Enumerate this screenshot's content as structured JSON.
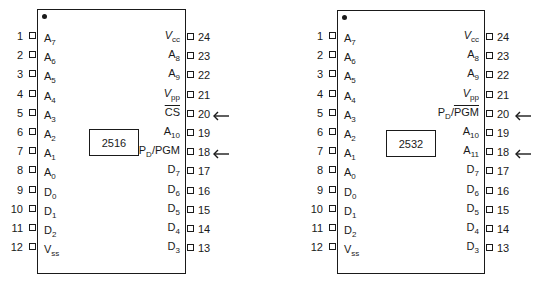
{
  "chips": [
    {
      "part_number": "2516",
      "left_pins": [
        {
          "num": "1",
          "name": "A",
          "sub": "7"
        },
        {
          "num": "2",
          "name": "A",
          "sub": "6"
        },
        {
          "num": "3",
          "name": "A",
          "sub": "5"
        },
        {
          "num": "4",
          "name": "A",
          "sub": "4"
        },
        {
          "num": "5",
          "name": "A",
          "sub": "3"
        },
        {
          "num": "6",
          "name": "A",
          "sub": "2"
        },
        {
          "num": "7",
          "name": "A",
          "sub": "1"
        },
        {
          "num": "8",
          "name": "A",
          "sub": "0"
        },
        {
          "num": "9",
          "name": "D",
          "sub": "0"
        },
        {
          "num": "10",
          "name": "D",
          "sub": "1"
        },
        {
          "num": "11",
          "name": "D",
          "sub": "2"
        },
        {
          "num": "12",
          "name": "V",
          "sub": "ss"
        }
      ],
      "right_pins": [
        {
          "num": "24",
          "name": "V",
          "sub": "cc",
          "italic": true
        },
        {
          "num": "23",
          "name": "A",
          "sub": "8"
        },
        {
          "num": "22",
          "name": "A",
          "sub": "9"
        },
        {
          "num": "21",
          "name": "V",
          "sub": "pp",
          "italic": true
        },
        {
          "num": "20",
          "name": "CS",
          "sub": "",
          "overline": true,
          "arrow": true
        },
        {
          "num": "19",
          "name": "A",
          "sub": "10"
        },
        {
          "num": "18",
          "name": "P",
          "sub": "D",
          "suffix": "/PGM",
          "arrow": true
        },
        {
          "num": "17",
          "name": "D",
          "sub": "7"
        },
        {
          "num": "16",
          "name": "D",
          "sub": "6"
        },
        {
          "num": "15",
          "name": "D",
          "sub": "5"
        },
        {
          "num": "14",
          "name": "D",
          "sub": "4"
        },
        {
          "num": "13",
          "name": "D",
          "sub": "3"
        }
      ]
    },
    {
      "part_number": "2532",
      "left_pins": [
        {
          "num": "1",
          "name": "A",
          "sub": "7"
        },
        {
          "num": "2",
          "name": "A",
          "sub": "6"
        },
        {
          "num": "3",
          "name": "A",
          "sub": "5"
        },
        {
          "num": "4",
          "name": "A",
          "sub": "4"
        },
        {
          "num": "5",
          "name": "A",
          "sub": "3"
        },
        {
          "num": "6",
          "name": "A",
          "sub": "2"
        },
        {
          "num": "7",
          "name": "A",
          "sub": "1"
        },
        {
          "num": "8",
          "name": "A",
          "sub": "0"
        },
        {
          "num": "9",
          "name": "D",
          "sub": "0"
        },
        {
          "num": "10",
          "name": "D",
          "sub": "1"
        },
        {
          "num": "11",
          "name": "D",
          "sub": "2"
        },
        {
          "num": "12",
          "name": "V",
          "sub": "ss"
        }
      ],
      "right_pins": [
        {
          "num": "24",
          "name": "V",
          "sub": "cc",
          "italic": true
        },
        {
          "num": "23",
          "name": "A",
          "sub": "8"
        },
        {
          "num": "22",
          "name": "A",
          "sub": "9"
        },
        {
          "num": "21",
          "name": "V",
          "sub": "pp",
          "italic": true
        },
        {
          "num": "20",
          "name": "P",
          "sub": "D",
          "suffix": "/",
          "suffix_overline": "PGM",
          "arrow": true
        },
        {
          "num": "19",
          "name": "A",
          "sub": "10"
        },
        {
          "num": "18",
          "name": "A",
          "sub": "11",
          "arrow": true
        },
        {
          "num": "17",
          "name": "D",
          "sub": "7"
        },
        {
          "num": "16",
          "name": "D",
          "sub": "6"
        },
        {
          "num": "15",
          "name": "D",
          "sub": "5"
        },
        {
          "num": "14",
          "name": "D",
          "sub": "4"
        },
        {
          "num": "13",
          "name": "D",
          "sub": "3"
        }
      ]
    }
  ]
}
